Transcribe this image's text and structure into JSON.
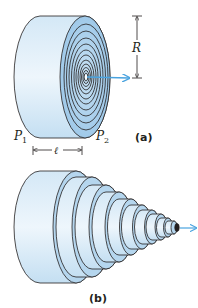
{
  "figure": {
    "panel_a": {
      "label": "(a)",
      "radius_label": "R",
      "length_label": "ℓ",
      "pressure_left": {
        "symbol": "P",
        "subscript": "1"
      },
      "pressure_right": {
        "symbol": "P",
        "subscript": "2"
      },
      "ring_count": 11
    },
    "panel_b": {
      "label": "(b)",
      "step_count": 11
    },
    "colors": {
      "fluid_light": "#dcecf8",
      "fluid_mid": "#b9d8ef",
      "fluid_dark": "#9cc7e8",
      "outline": "#231f20",
      "flow_arrow": "#4aa3df"
    }
  }
}
